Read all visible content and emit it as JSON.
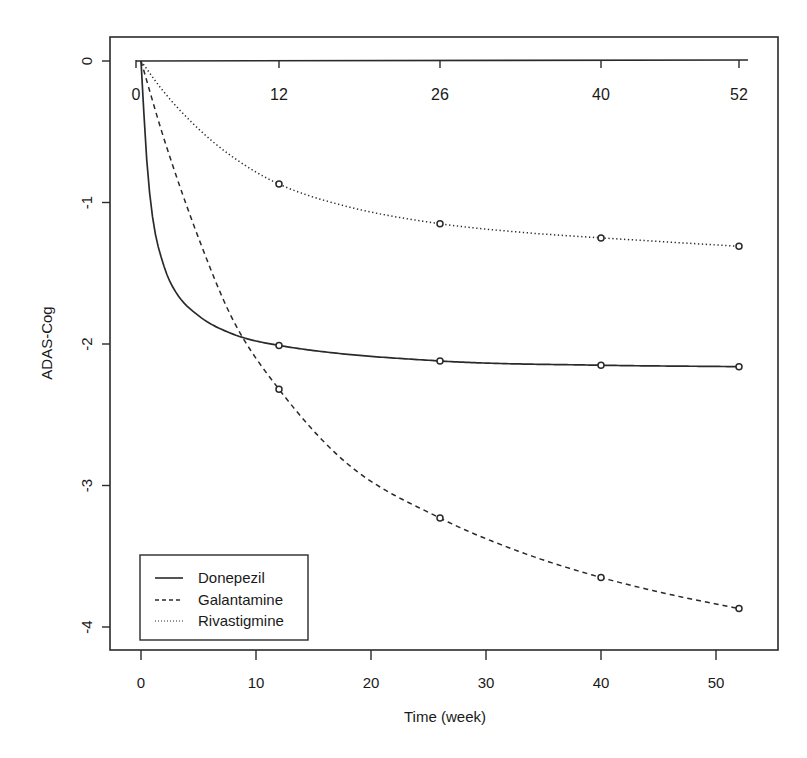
{
  "chart_data": {
    "type": "line",
    "title": "",
    "xlabel": "Time (week)",
    "ylabel": "ADAS-Cog",
    "xlim": [
      -1.5,
      55
    ],
    "ylim": [
      -4.15,
      0.17
    ],
    "x_ticks": [
      0,
      10,
      20,
      30,
      40,
      50
    ],
    "y_ticks": [
      0,
      -1,
      -2,
      -3,
      -4
    ],
    "top_axis_ticks": [
      0,
      12,
      26,
      40,
      52
    ],
    "grid": false,
    "legend_position": "bottom-left",
    "series": [
      {
        "name": "Donepezil",
        "line_style": "solid",
        "x": [
          0,
          12,
          26,
          40,
          52
        ],
        "values": [
          0,
          -2.01,
          -2.12,
          -2.15,
          -2.16
        ]
      },
      {
        "name": "Galantamine",
        "line_style": "dashed",
        "x": [
          0,
          12,
          26,
          40,
          52
        ],
        "values": [
          0,
          -2.32,
          -3.23,
          -3.65,
          -3.87
        ]
      },
      {
        "name": "Rivastigmine",
        "line_style": "dotted",
        "x": [
          0,
          12,
          26,
          40,
          52
        ],
        "values": [
          0,
          -0.87,
          -1.15,
          -1.25,
          -1.31
        ]
      }
    ]
  },
  "colors": {
    "line": "#2a2a2a",
    "background": "#ffffff"
  },
  "legend": {
    "items": [
      "Donepezil",
      "Galantamine",
      "Rivastigmine"
    ]
  },
  "labels": {
    "xlabel": "Time (week)",
    "ylabel": "ADAS-Cog",
    "x_ticks": [
      "0",
      "10",
      "20",
      "30",
      "40",
      "50"
    ],
    "y_ticks": [
      "0",
      "-1",
      "-2",
      "-3",
      "-4"
    ],
    "top_ticks": [
      "0",
      "12",
      "26",
      "40",
      "52"
    ]
  }
}
